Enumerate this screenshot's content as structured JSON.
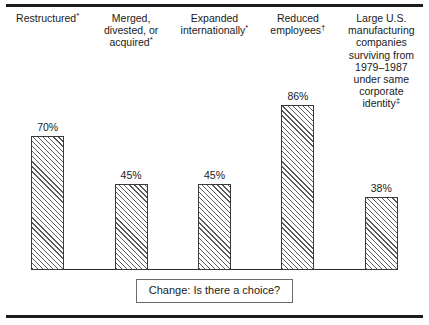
{
  "chart_data": {
    "type": "bar",
    "title": "",
    "xlabel": "",
    "ylabel": "",
    "ylim": [
      0,
      100
    ],
    "grid": false,
    "legend": "none",
    "categories": [
      "Restructured*",
      "Merged, divested, or acquired*",
      "Expanded internationally*",
      "Reduced employees†",
      "Large U.S. manufacturing companies surviving from 1979–1987 under same corporate identity‡"
    ],
    "values": [
      70,
      45,
      45,
      86,
      38
    ],
    "value_labels": [
      "70%",
      "45%",
      "45%",
      "86%",
      "38%"
    ],
    "annotations": [
      "Change: Is there a choice?"
    ]
  },
  "figure": {
    "columns": [
      {
        "lines": [
          "Restructured"
        ],
        "marker": "*",
        "value_label": "70%",
        "value": 70
      },
      {
        "lines": [
          "Merged,",
          "divested, or",
          "acquired"
        ],
        "marker": "*",
        "value_label": "45%",
        "value": 45
      },
      {
        "lines": [
          "Expanded",
          "internationally"
        ],
        "marker": "*",
        "value_label": "45%",
        "value": 45
      },
      {
        "lines": [
          "Reduced",
          "employees"
        ],
        "marker": "†",
        "value_label": "86%",
        "value": 86
      },
      {
        "lines": [
          "Large U.S.",
          "manufacturing",
          "companies",
          "surviving from",
          "1979–1987",
          "under same",
          "corporate",
          "identity"
        ],
        "marker": "‡",
        "value_label": "38%",
        "value": 38
      }
    ],
    "caption": "Change: Is there a choice?"
  },
  "colors": {
    "rule": "#1c1c1c",
    "bar_outline": "#3a3a3a",
    "bar_hatch": "#5a5a5a",
    "text": "#1a1a1a",
    "caption_border": "#6a6a6a",
    "background": "#ffffff"
  }
}
